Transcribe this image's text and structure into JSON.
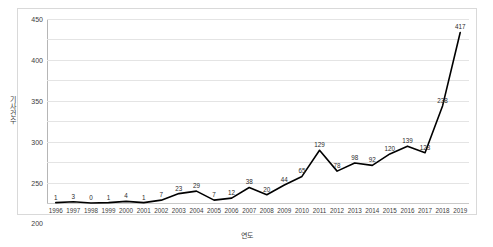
{
  "chart_data": {
    "type": "line",
    "title": "",
    "xlabel": "연도",
    "ylabel": "기사건수",
    "ylim": [
      0,
      450
    ],
    "ytick_step": 50,
    "yticks": [
      0,
      50,
      100,
      150,
      200,
      250,
      300,
      350,
      400,
      450
    ],
    "grid": true,
    "legend": "none",
    "show_data_labels": true,
    "line_color": "#000000",
    "grid_color": "#e4e4e4",
    "axis_color": "#b6b6b6",
    "categories": [
      "1996",
      "1997",
      "1998",
      "1999",
      "2000",
      "2001",
      "2002",
      "2003",
      "2004",
      "2005",
      "2006",
      "2007",
      "2008",
      "2009",
      "2010",
      "2011",
      "2012",
      "2013",
      "2014",
      "2015",
      "2016",
      "2017",
      "2018",
      "2019"
    ],
    "values": [
      1,
      3,
      0,
      1,
      4,
      1,
      7,
      23,
      29,
      7,
      12,
      38,
      20,
      44,
      65,
      129,
      78,
      98,
      92,
      120,
      139,
      123,
      238,
      417
    ],
    "series": [
      {
        "name": "기사건수",
        "values": [
          1,
          3,
          0,
          1,
          4,
          1,
          7,
          23,
          29,
          7,
          12,
          38,
          20,
          44,
          65,
          129,
          78,
          98,
          92,
          120,
          139,
          123,
          238,
          417
        ]
      }
    ]
  }
}
